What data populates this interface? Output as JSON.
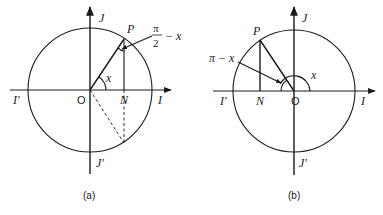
{
  "figures": [
    {
      "id": "a",
      "caption": "(a)",
      "labels": {
        "J": "J",
        "J_prime": "J′",
        "I": "I",
        "I_prime": "I′",
        "origin": "O",
        "N": "N",
        "P": "P",
        "angle_x": "x",
        "complement_num": "π",
        "complement_den": "2",
        "complement_minus": "− x"
      }
    },
    {
      "id": "b",
      "caption": "(b)",
      "labels": {
        "J": "J",
        "J_prime": "J′",
        "I": "I",
        "I_prime": "I′",
        "origin": "O",
        "N": "N",
        "P": "P",
        "angle_x": "x",
        "supplement": "π − x"
      }
    }
  ]
}
